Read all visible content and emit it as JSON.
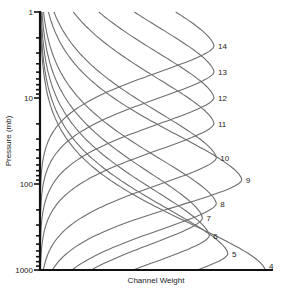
{
  "chart_data": {
    "type": "line",
    "title": "",
    "xlabel": "Channel Weight",
    "ylabel": "Pressure (mb)",
    "y_scale": "log",
    "y_inverted": true,
    "ylim": [
      1000,
      1
    ],
    "xlim": [
      0,
      1
    ],
    "y_ticks": [
      1,
      10,
      100,
      1000
    ],
    "y_tick_labels": [
      "1",
      "10",
      "100",
      "1000"
    ],
    "grid": false,
    "legend": "none (curves labeled inline at right)",
    "series": [
      {
        "name": "14",
        "peak_pressure": 2.5,
        "peak_weight": 0.75
      },
      {
        "name": "13",
        "peak_pressure": 5,
        "peak_weight": 0.75
      },
      {
        "name": "12",
        "peak_pressure": 10,
        "peak_weight": 0.75
      },
      {
        "name": "11",
        "peak_pressure": 20,
        "peak_weight": 0.75
      },
      {
        "name": "10",
        "peak_pressure": 50,
        "peak_weight": 0.76
      },
      {
        "name": "9",
        "peak_pressure": 90,
        "peak_weight": 0.87
      },
      {
        "name": "8",
        "peak_pressure": 170,
        "peak_weight": 0.76
      },
      {
        "name": "7",
        "peak_pressure": 250,
        "peak_weight": 0.7
      },
      {
        "name": "6",
        "peak_pressure": 400,
        "peak_weight": 0.73
      },
      {
        "name": "5",
        "peak_pressure": 650,
        "peak_weight": 0.81
      },
      {
        "name": "4",
        "peak_pressure": 1000,
        "peak_weight": 0.97
      }
    ]
  }
}
